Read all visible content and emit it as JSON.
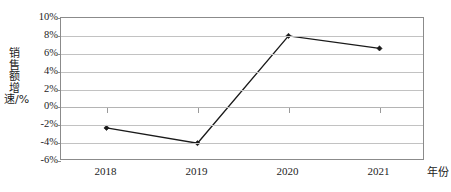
{
  "chart_data": {
    "type": "line",
    "title": "",
    "xlabel": "年份",
    "ylabel": "销售额增速/%",
    "categories": [
      "2018",
      "2019",
      "2020",
      "2021"
    ],
    "values": [
      -2.3,
      -4.0,
      8.0,
      6.6
    ],
    "series": [
      {
        "name": "销售额增速",
        "values": [
          -2.3,
          -4.0,
          8.0,
          6.6
        ]
      }
    ],
    "ylim": [
      -6,
      10
    ],
    "ytick_values": [
      10,
      8,
      6,
      4,
      2,
      0,
      -2,
      -4,
      -6
    ],
    "ytick_labels": [
      "10%",
      "8%",
      "6%",
      "4%",
      "2%",
      "0%",
      "-2%",
      "-4%",
      "-6%"
    ],
    "grid": true,
    "legend": "none",
    "marker": "diamond",
    "line_color": "#1a1a1a",
    "marker_color": "#1a1a1a",
    "grid_color": "#c2c2c2",
    "frame_color": "#8b8b8b",
    "background_color": "#ffffff"
  }
}
